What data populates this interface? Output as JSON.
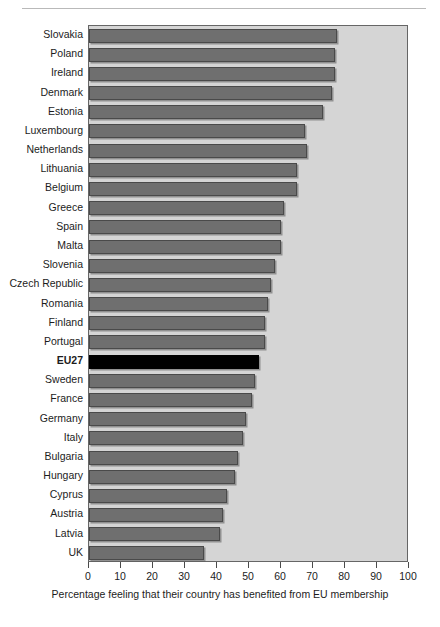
{
  "chart_data": {
    "type": "bar",
    "orientation": "horizontal",
    "title": "",
    "subtitle": "",
    "xlabel": "Percentage feeling that their country has benefited from EU membership",
    "ylabel": "",
    "xlim": [
      0,
      100
    ],
    "xticks": [
      0,
      10,
      20,
      30,
      40,
      50,
      60,
      70,
      80,
      90,
      100
    ],
    "xtick_labels": [
      "0",
      "10",
      "20",
      "30",
      "40",
      "50",
      "60",
      "70",
      "80",
      "90",
      "100"
    ],
    "grid": false,
    "legend": false,
    "legend_position": "none",
    "categories": [
      "Slovakia",
      "Poland",
      "Ireland",
      "Denmark",
      "Estonia",
      "Luxembourg",
      "Netherlands",
      "Lithuania",
      "Belgium",
      "Greece",
      "Spain",
      "Malta",
      "Slovenia",
      "Czech Republic",
      "Romania",
      "Finland",
      "Portugal",
      "EU27",
      "Sweden",
      "France",
      "Germany",
      "Italy",
      "Bulgaria",
      "Hungary",
      "Cyprus",
      "Austria",
      "Latvia",
      "UK"
    ],
    "values": [
      77.5,
      77,
      77,
      76,
      73,
      67.5,
      68,
      65,
      65,
      61,
      60,
      60,
      58,
      57,
      56,
      55,
      55,
      53,
      52,
      51,
      49,
      48,
      46.5,
      45.5,
      43,
      42,
      41,
      36
    ],
    "highlight_category": "EU27",
    "colors": {
      "bar": "#6f6f6f",
      "bar_border": "#4a4a4a",
      "highlight_bar": "#000000",
      "plot_background": "#d5d5d5",
      "page_background": "#ffffff",
      "text": "#1c1c1c"
    }
  }
}
